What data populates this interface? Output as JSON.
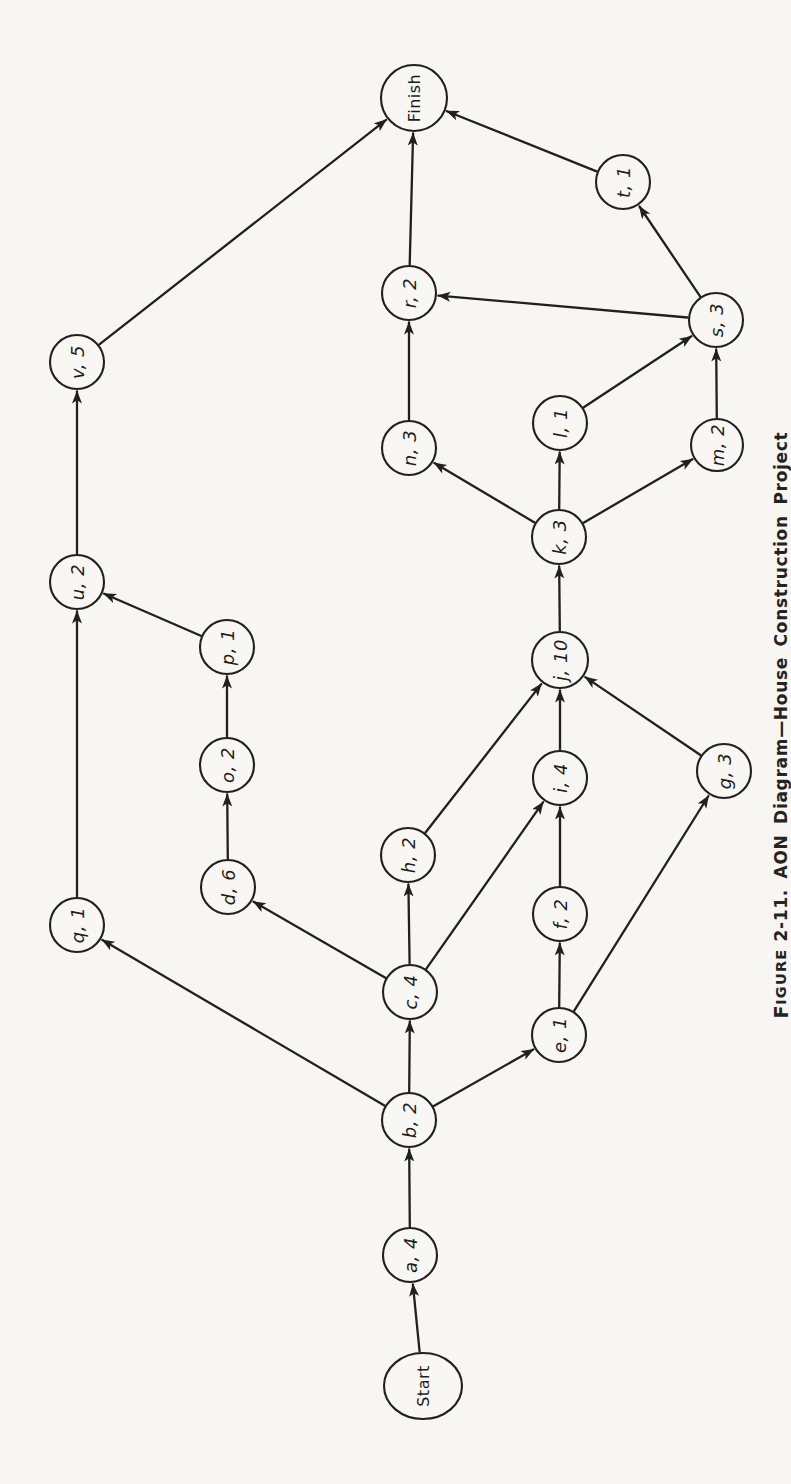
{
  "figure_caption": {
    "word_initial": "F",
    "word_rest": "IGURE",
    "rest": "2-11. AON Diagram—House Construction Project",
    "full_text": "FIGURE 2-11. AON Diagram—House Construction Project"
  },
  "colors": {
    "paper": "#f7f6f3",
    "ink": "#221f1c"
  },
  "diagram": {
    "type": "aon-activity-network",
    "orientation": "rotated-90-labels-read-bottom-to-top",
    "nodes": [
      {
        "id": "start",
        "label": "Start",
        "x": 423,
        "y": 1386,
        "rx": 39,
        "ry": 33,
        "upright": true
      },
      {
        "id": "a",
        "label": "a, 4",
        "x": 410,
        "y": 1255,
        "r": 27
      },
      {
        "id": "b",
        "label": "b, 2",
        "x": 409,
        "y": 1120,
        "r": 27
      },
      {
        "id": "c",
        "label": "c, 4",
        "x": 410,
        "y": 992,
        "r": 27
      },
      {
        "id": "e",
        "label": "e, 1",
        "x": 559,
        "y": 1035,
        "r": 27
      },
      {
        "id": "f",
        "label": "f, 2",
        "x": 560,
        "y": 914,
        "r": 27
      },
      {
        "id": "g",
        "label": "g, 3",
        "x": 724,
        "y": 771,
        "r": 27
      },
      {
        "id": "h",
        "label": "h, 2",
        "x": 408,
        "y": 855,
        "r": 27
      },
      {
        "id": "i",
        "label": "i, 4",
        "x": 560,
        "y": 778,
        "r": 27
      },
      {
        "id": "j",
        "label": "j, 10",
        "x": 560,
        "y": 660,
        "r": 28
      },
      {
        "id": "k",
        "label": "k, 3",
        "x": 559,
        "y": 537,
        "r": 27
      },
      {
        "id": "l",
        "label": "l, 1",
        "x": 560,
        "y": 423,
        "r": 27
      },
      {
        "id": "m",
        "label": "m, 2",
        "x": 717,
        "y": 445,
        "r": 26
      },
      {
        "id": "n",
        "label": "n, 3",
        "x": 409,
        "y": 448,
        "r": 27
      },
      {
        "id": "d",
        "label": "d, 6",
        "x": 228,
        "y": 887,
        "r": 27
      },
      {
        "id": "o",
        "label": "o, 2",
        "x": 227,
        "y": 765,
        "r": 27
      },
      {
        "id": "p",
        "label": "p, 1",
        "x": 227,
        "y": 647,
        "r": 27
      },
      {
        "id": "q",
        "label": "q, 1",
        "x": 77,
        "y": 925,
        "r": 27
      },
      {
        "id": "u",
        "label": "u, 2",
        "x": 77,
        "y": 582,
        "r": 27
      },
      {
        "id": "v",
        "label": "v, 5",
        "x": 77,
        "y": 362,
        "r": 27
      },
      {
        "id": "r",
        "label": "r, 2",
        "x": 409,
        "y": 293,
        "r": 27
      },
      {
        "id": "s",
        "label": "s, 3",
        "x": 716,
        "y": 320,
        "r": 27
      },
      {
        "id": "t",
        "label": "t, 1",
        "x": 623,
        "y": 182,
        "r": 27
      },
      {
        "id": "finish",
        "label": "Finish",
        "x": 414,
        "y": 98,
        "r": 33,
        "upright": true
      }
    ],
    "edges": [
      {
        "from": "start",
        "to": "a"
      },
      {
        "from": "a",
        "to": "b"
      },
      {
        "from": "b",
        "to": "c"
      },
      {
        "from": "b",
        "to": "e"
      },
      {
        "from": "b",
        "to": "q"
      },
      {
        "from": "c",
        "to": "d"
      },
      {
        "from": "c",
        "to": "h"
      },
      {
        "from": "c",
        "to": "i"
      },
      {
        "from": "d",
        "to": "o"
      },
      {
        "from": "o",
        "to": "p"
      },
      {
        "from": "p",
        "to": "u"
      },
      {
        "from": "q",
        "to": "u"
      },
      {
        "from": "u",
        "to": "v"
      },
      {
        "from": "v",
        "to": "finish"
      },
      {
        "from": "e",
        "to": "f"
      },
      {
        "from": "e",
        "to": "g"
      },
      {
        "from": "f",
        "to": "i"
      },
      {
        "from": "h",
        "to": "j"
      },
      {
        "from": "i",
        "to": "j"
      },
      {
        "from": "g",
        "to": "j"
      },
      {
        "from": "j",
        "to": "k"
      },
      {
        "from": "k",
        "to": "n"
      },
      {
        "from": "k",
        "to": "l"
      },
      {
        "from": "k",
        "to": "m"
      },
      {
        "from": "l",
        "to": "s"
      },
      {
        "from": "m",
        "to": "s"
      },
      {
        "from": "n",
        "to": "r"
      },
      {
        "from": "s",
        "to": "r"
      },
      {
        "from": "s",
        "to": "t"
      },
      {
        "from": "r",
        "to": "finish"
      },
      {
        "from": "t",
        "to": "finish"
      }
    ]
  }
}
